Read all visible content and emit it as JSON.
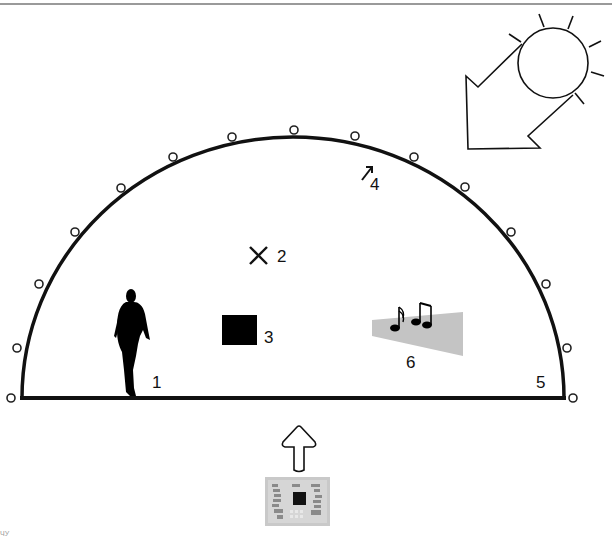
{
  "diagram": {
    "title": "",
    "labels": {
      "person": "1",
      "cross_marker": "2",
      "black_square": "3",
      "small_arrow": "4",
      "corner_marker": "5",
      "sound_zone": "6"
    },
    "corner_text": "ЧУ",
    "elements": [
      {
        "id": 1,
        "name": "walking person silhouette"
      },
      {
        "id": 2,
        "name": "cross marker"
      },
      {
        "id": 3,
        "name": "black square"
      },
      {
        "id": 4,
        "name": "small arrow pointing up-right near dome"
      },
      {
        "id": 5,
        "name": "dome edge / ground corner"
      },
      {
        "id": 6,
        "name": "music notes over grey sound beam"
      }
    ],
    "decorations": [
      "sun with rays",
      "large hollow arrow from sun pointing down-left",
      "hollow up arrow",
      "circuit board module"
    ],
    "colors": {
      "stroke": "#111111",
      "sound_beam": "#c4c4c4",
      "top_rule": "#9a9a9a",
      "board": "#bdbdbd"
    }
  }
}
